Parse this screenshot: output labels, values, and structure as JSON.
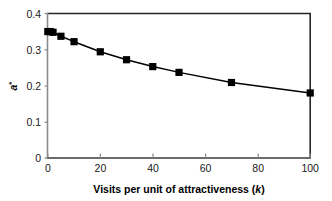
{
  "chart_data": {
    "type": "line",
    "title": "",
    "subtitle": "",
    "xlabel": "Visits per unit of attractiveness (k)",
    "xlabel_plain": "Visits per unit of attractiveness (",
    "xlabel_italic": "k",
    "xlabel_tail": ")",
    "ylabel": "a*",
    "ylabel_base": "a",
    "ylabel_sup": "*",
    "xlim": [
      0,
      100
    ],
    "ylim": [
      0,
      0.4
    ],
    "xticks": [
      0,
      20,
      40,
      60,
      80,
      100
    ],
    "xtick_labels": [
      "0",
      "20",
      "40",
      "60",
      "80",
      "100"
    ],
    "yticks": [
      0,
      0.1,
      0.2,
      0.3,
      0.4
    ],
    "ytick_labels": [
      "0",
      "0.1",
      "0.2",
      "0.3",
      "0.4"
    ],
    "grid": false,
    "legend": false,
    "legend_position": "none",
    "marker": "filled-square",
    "marker_color": "#000000",
    "line_color": "#000000",
    "x": [
      0,
      1,
      2,
      5,
      10,
      20,
      30,
      40,
      50,
      70,
      100
    ],
    "y": [
      0.35,
      0.35,
      0.348,
      0.337,
      0.322,
      0.294,
      0.272,
      0.253,
      0.237,
      0.209,
      0.18
    ],
    "series": [
      {
        "name": "a*",
        "x": [
          0,
          1,
          2,
          5,
          10,
          20,
          30,
          40,
          50,
          70,
          100
        ],
        "values": [
          0.35,
          0.35,
          0.348,
          0.337,
          0.322,
          0.294,
          0.272,
          0.253,
          0.237,
          0.209,
          0.18
        ]
      }
    ]
  },
  "style": {
    "background": "#ffffff",
    "axis_line_color": "#808080",
    "frame_color": "#262626",
    "text_color": "#1a1a1a"
  }
}
